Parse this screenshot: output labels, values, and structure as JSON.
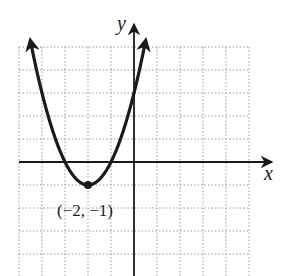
{
  "chart_data": {
    "type": "line",
    "title": "",
    "xlabel": "x",
    "ylabel": "y",
    "function": "y = (x + 2)^2 - 1",
    "xlim": [
      -5,
      5
    ],
    "ylim": [
      -5,
      5
    ],
    "grid": true,
    "grid_step": 1,
    "series": [
      {
        "name": "parabola",
        "x": [
          -4.5,
          -4,
          -3.5,
          -3,
          -2.5,
          -2,
          -1.5,
          -1,
          -0.5,
          0,
          0.5
        ],
        "values": [
          5.25,
          3,
          1.25,
          0,
          -0.75,
          -1,
          -0.75,
          0,
          1.25,
          3,
          5.25
        ]
      }
    ],
    "annotations": [
      {
        "text": "(−2, −1)",
        "x": -2,
        "y": -1,
        "type": "vertex"
      }
    ]
  },
  "labels": {
    "x_axis": "x",
    "y_axis": "y",
    "vertex": "(−2, −1)"
  }
}
